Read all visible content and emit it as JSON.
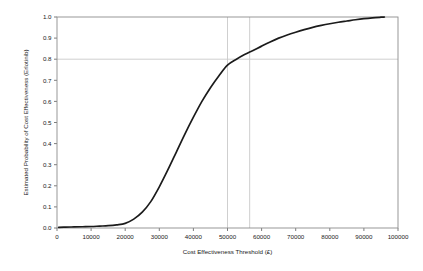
{
  "chart_data": {
    "type": "line",
    "title": "",
    "subtitle": "",
    "xlabel": "Cost Effectiveness Threshold (£)",
    "ylabel": "Estimated Probability of Cost Effectiveness (Erlotinib)",
    "xlim": [
      0,
      100000
    ],
    "ylim": [
      0.0,
      1.0
    ],
    "grid": false,
    "legend": null,
    "x_ticks": [
      0,
      10000,
      20000,
      30000,
      40000,
      50000,
      60000,
      70000,
      80000,
      90000,
      100000
    ],
    "x_tick_labels": [
      "0",
      "10000",
      "20000",
      "30000",
      "40000",
      "50000",
      "60000",
      "70000",
      "80000",
      "90000",
      "100000"
    ],
    "y_ticks": [
      0.0,
      0.1,
      0.2,
      0.3,
      0.4,
      0.5,
      0.6,
      0.7,
      0.8,
      0.9,
      1.0
    ],
    "y_tick_labels": [
      "0.0",
      "0.1",
      "0.2",
      "0.3",
      "0.4",
      "0.5",
      "0.6",
      "0.7",
      "0.8",
      "0.9",
      "1.0"
    ],
    "series": [
      {
        "name": "Estimated probability of cost effectiveness (Erlotinib)",
        "color": "#1b1b1b",
        "x": [
          500,
          2500,
          5000,
          7500,
          10000,
          12500,
          15000,
          17500,
          20000,
          22500,
          25000,
          27500,
          30000,
          32500,
          35000,
          37500,
          40000,
          42500,
          45000,
          47500,
          50000,
          52500,
          55000,
          56500,
          57500,
          60000,
          62500,
          65000,
          67500,
          70000,
          72500,
          75000,
          77500,
          80000,
          82500,
          85000,
          87500,
          90000,
          92500,
          95000,
          96000
        ],
        "y": [
          0.003,
          0.004,
          0.005,
          0.006,
          0.007,
          0.009,
          0.011,
          0.015,
          0.022,
          0.042,
          0.075,
          0.125,
          0.195,
          0.275,
          0.36,
          0.445,
          0.525,
          0.6,
          0.665,
          0.722,
          0.772,
          0.799,
          0.822,
          0.834,
          0.841,
          0.862,
          0.882,
          0.9,
          0.915,
          0.928,
          0.94,
          0.951,
          0.96,
          0.968,
          0.975,
          0.981,
          0.987,
          0.992,
          0.996,
          0.999,
          1.0
        ]
      }
    ],
    "reference_lines": [
      {
        "name": "threshold-50000",
        "orientation": "vertical",
        "value": 50000,
        "color": "#c9c9c9"
      },
      {
        "name": "threshold-56500",
        "orientation": "vertical",
        "value": 56500,
        "color": "#c9c9c9"
      },
      {
        "name": "probability-0.8",
        "orientation": "horizontal",
        "value": 0.8,
        "color": "#c9c9c9"
      }
    ],
    "annotations": []
  }
}
